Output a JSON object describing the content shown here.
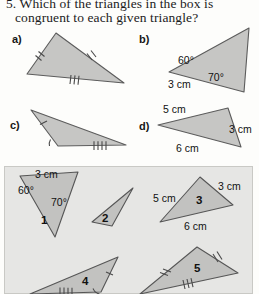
{
  "question": {
    "line1": "5. Which of the triangles in the box is",
    "line2": "congruent to each given triangle?"
  },
  "parts": [
    {
      "id": "a",
      "label": "a)"
    },
    {
      "id": "b",
      "label": "b)"
    },
    {
      "id": "c",
      "label": "c)"
    },
    {
      "id": "d",
      "label": "d)"
    }
  ],
  "given_triangles": {
    "a": {
      "label": "a)",
      "marks": "two sides with double ticks, base with triple ticks",
      "labels": []
    },
    "b": {
      "label": "b)",
      "angle_left": "60°",
      "angle_right": "70°",
      "side_bottom": "3 cm"
    },
    "c": {
      "label": "c)",
      "marks": "one side single tick, angle arc at base, base quadruple ticks",
      "labels": []
    },
    "d": {
      "label": "d)",
      "side_top": "5 cm",
      "side_right": "3 cm",
      "side_bottom": "6 cm"
    }
  },
  "answer_box": {
    "background_color": "#e6e6e4",
    "border_color": "#c9c9c5",
    "triangles": [
      {
        "number": "1",
        "side_top": "3 cm",
        "angle_left": "60°",
        "angle_right": "70°"
      },
      {
        "number": "2",
        "labels": []
      },
      {
        "number": "3",
        "side_left": "5 cm",
        "side_right": "3 cm",
        "side_bottom": "6 cm"
      },
      {
        "number": "4",
        "marks": "single tick on right side, angle arc at base right, quadruple ticks on base"
      },
      {
        "number": "5",
        "marks": "double ticks on two sides, triple ticks on base"
      }
    ]
  },
  "colors": {
    "page_background": "#fdfdfb",
    "triangle_fill": "#c6c6c4",
    "triangle_stroke": "#5c5c5c",
    "box_fill": "#e6e6e4",
    "text": "#1a1a1a"
  }
}
